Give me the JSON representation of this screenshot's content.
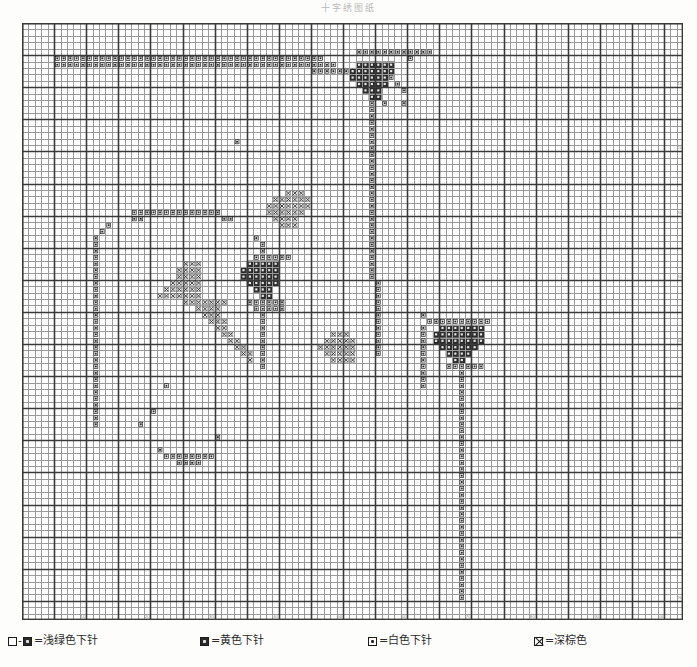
{
  "title": "十字绣图纸",
  "chart_data": {
    "type": "heatmap",
    "title": "十字绣图纸",
    "subtitle": "Cross-stitch pattern chart",
    "xlabel": "",
    "ylabel": "",
    "grid": true,
    "legend_position": "bottom",
    "columns": 103,
    "rows": 93,
    "cell_px": 6.42,
    "bold_every": 5,
    "axis_tick_interval": 10,
    "x_tick_labels": [
      "10",
      "20",
      "30",
      "40",
      "50",
      "60",
      "70",
      "80",
      "90",
      "100"
    ],
    "y_tick_labels": [
      "10",
      "20",
      "30",
      "40",
      "50",
      "60",
      "70",
      "80",
      "90"
    ],
    "symbols": {
      "A": "white-stitch",
      "X": "dark-brown-stitch",
      "F": "yellow-stitch",
      "G": "light-green-stitch"
    },
    "palette": {
      "background": "#ffffff",
      "grid_line": "#9a9a9a",
      "grid_bold": "#3a3a3a",
      "symbol_ink": "#222222",
      "fill_dark": "#2b2b2b"
    },
    "cells": [
      {
        "s": "A",
        "r": 5,
        "c": 5,
        "w": 38,
        "h": 2
      },
      {
        "s": "A",
        "r": 5,
        "c": 38,
        "w": 1,
        "h": 1
      },
      {
        "s": "A",
        "r": 4,
        "c": 52,
        "w": 12,
        "h": 1
      },
      {
        "s": "A",
        "r": 5,
        "c": 37,
        "w": 10,
        "h": 2
      },
      {
        "s": "A",
        "r": 6,
        "c": 41,
        "w": 8,
        "h": 1
      },
      {
        "s": "A",
        "r": 7,
        "c": 45,
        "w": 6,
        "h": 1
      },
      {
        "s": "A",
        "r": 4,
        "c": 60,
        "w": 1,
        "h": 1
      },
      {
        "s": "A",
        "r": 5,
        "c": 60,
        "w": 1,
        "h": 1
      },
      {
        "s": "F",
        "r": 6,
        "c": 52,
        "w": 6,
        "h": 1
      },
      {
        "s": "F",
        "r": 7,
        "c": 51,
        "w": 7,
        "h": 1
      },
      {
        "s": "F",
        "r": 8,
        "c": 51,
        "w": 6,
        "h": 1
      },
      {
        "s": "F",
        "r": 9,
        "c": 52,
        "w": 5,
        "h": 1
      },
      {
        "s": "F",
        "r": 10,
        "c": 53,
        "w": 3,
        "h": 1
      },
      {
        "s": "F",
        "r": 11,
        "c": 54,
        "w": 2,
        "h": 1
      },
      {
        "s": "A",
        "r": 8,
        "c": 57,
        "w": 1,
        "h": 1
      },
      {
        "s": "A",
        "r": 9,
        "c": 58,
        "w": 1,
        "h": 1
      },
      {
        "s": "A",
        "r": 10,
        "c": 59,
        "w": 1,
        "h": 1
      },
      {
        "s": "A",
        "r": 12,
        "c": 56,
        "w": 1,
        "h": 1
      },
      {
        "s": "A",
        "r": 12,
        "c": 59,
        "w": 1,
        "h": 1
      },
      {
        "s": "A",
        "r": 12,
        "c": 54,
        "w": 1,
        "h": 28
      },
      {
        "s": "A",
        "r": 40,
        "c": 55,
        "w": 1,
        "h": 12
      },
      {
        "s": "A",
        "r": 18,
        "c": 33,
        "w": 1,
        "h": 1
      },
      {
        "s": "X",
        "r": 26,
        "c": 41,
        "w": 3,
        "h": 1
      },
      {
        "s": "X",
        "r": 27,
        "c": 39,
        "w": 6,
        "h": 1
      },
      {
        "s": "X",
        "r": 28,
        "c": 38,
        "w": 7,
        "h": 1
      },
      {
        "s": "X",
        "r": 29,
        "c": 38,
        "w": 6,
        "h": 1
      },
      {
        "s": "X",
        "r": 30,
        "c": 39,
        "w": 4,
        "h": 1
      },
      {
        "s": "X",
        "r": 31,
        "c": 40,
        "w": 3,
        "h": 1
      },
      {
        "s": "A",
        "r": 29,
        "c": 17,
        "w": 14,
        "h": 1
      },
      {
        "s": "A",
        "r": 30,
        "c": 17,
        "w": 2,
        "h": 1
      },
      {
        "s": "A",
        "r": 30,
        "c": 31,
        "w": 2,
        "h": 1
      },
      {
        "s": "A",
        "r": 31,
        "c": 13,
        "w": 1,
        "h": 1
      },
      {
        "s": "A",
        "r": 32,
        "c": 12,
        "w": 1,
        "h": 1
      },
      {
        "s": "A",
        "r": 33,
        "c": 36,
        "w": 1,
        "h": 1
      },
      {
        "s": "A",
        "r": 33,
        "c": 11,
        "w": 1,
        "h": 30
      },
      {
        "s": "A",
        "r": 34,
        "c": 37,
        "w": 1,
        "h": 20
      },
      {
        "s": "X",
        "r": 37,
        "c": 25,
        "w": 3,
        "h": 1
      },
      {
        "s": "X",
        "r": 38,
        "c": 24,
        "w": 4,
        "h": 1
      },
      {
        "s": "X",
        "r": 39,
        "c": 24,
        "w": 4,
        "h": 1
      },
      {
        "s": "X",
        "r": 40,
        "c": 23,
        "w": 5,
        "h": 1
      },
      {
        "s": "X",
        "r": 41,
        "c": 22,
        "w": 6,
        "h": 1
      },
      {
        "s": "X",
        "r": 42,
        "c": 21,
        "w": 7,
        "h": 1
      },
      {
        "s": "X",
        "r": 43,
        "c": 25,
        "w": 7,
        "h": 1
      },
      {
        "s": "X",
        "r": 44,
        "c": 27,
        "w": 4,
        "h": 1
      },
      {
        "s": "X",
        "r": 45,
        "c": 28,
        "w": 3,
        "h": 1
      },
      {
        "s": "X",
        "r": 46,
        "c": 29,
        "w": 3,
        "h": 1
      },
      {
        "s": "X",
        "r": 47,
        "c": 30,
        "w": 2,
        "h": 1
      },
      {
        "s": "X",
        "r": 48,
        "c": 31,
        "w": 2,
        "h": 1
      },
      {
        "s": "X",
        "r": 49,
        "c": 32,
        "w": 2,
        "h": 1
      },
      {
        "s": "X",
        "r": 50,
        "c": 33,
        "w": 2,
        "h": 1
      },
      {
        "s": "X",
        "r": 51,
        "c": 34,
        "w": 2,
        "h": 1
      },
      {
        "s": "X",
        "r": 52,
        "c": 35,
        "w": 1,
        "h": 1
      },
      {
        "s": "F",
        "r": 37,
        "c": 35,
        "w": 5,
        "h": 1
      },
      {
        "s": "F",
        "r": 38,
        "c": 34,
        "w": 6,
        "h": 1
      },
      {
        "s": "F",
        "r": 39,
        "c": 34,
        "w": 6,
        "h": 1
      },
      {
        "s": "F",
        "r": 40,
        "c": 35,
        "w": 5,
        "h": 1
      },
      {
        "s": "F",
        "r": 41,
        "c": 36,
        "w": 3,
        "h": 1
      },
      {
        "s": "F",
        "r": 42,
        "c": 37,
        "w": 2,
        "h": 1
      },
      {
        "s": "A",
        "r": 36,
        "c": 36,
        "w": 6,
        "h": 1
      },
      {
        "s": "A",
        "r": 43,
        "c": 35,
        "w": 6,
        "h": 1
      },
      {
        "s": "A",
        "r": 44,
        "c": 36,
        "w": 5,
        "h": 1
      },
      {
        "s": "X",
        "r": 48,
        "c": 48,
        "w": 3,
        "h": 1
      },
      {
        "s": "X",
        "r": 49,
        "c": 47,
        "w": 5,
        "h": 1
      },
      {
        "s": "X",
        "r": 50,
        "c": 46,
        "w": 6,
        "h": 1
      },
      {
        "s": "X",
        "r": 51,
        "c": 47,
        "w": 5,
        "h": 1
      },
      {
        "s": "X",
        "r": 52,
        "c": 48,
        "w": 4,
        "h": 1
      },
      {
        "s": "F",
        "r": 47,
        "c": 65,
        "w": 7,
        "h": 1
      },
      {
        "s": "F",
        "r": 48,
        "c": 64,
        "w": 8,
        "h": 1
      },
      {
        "s": "F",
        "r": 49,
        "c": 64,
        "w": 8,
        "h": 1
      },
      {
        "s": "F",
        "r": 50,
        "c": 65,
        "w": 6,
        "h": 1
      },
      {
        "s": "F",
        "r": 51,
        "c": 66,
        "w": 4,
        "h": 1
      },
      {
        "s": "F",
        "r": 52,
        "c": 67,
        "w": 2,
        "h": 1
      },
      {
        "s": "A",
        "r": 46,
        "c": 63,
        "w": 10,
        "h": 1
      },
      {
        "s": "A",
        "r": 53,
        "c": 66,
        "w": 6,
        "h": 1
      },
      {
        "s": "A",
        "r": 45,
        "c": 62,
        "w": 1,
        "h": 1
      },
      {
        "s": "A",
        "r": 54,
        "c": 68,
        "w": 1,
        "h": 36
      },
      {
        "s": "A",
        "r": 47,
        "c": 62,
        "w": 1,
        "h": 10
      },
      {
        "s": "A",
        "r": 56,
        "c": 22,
        "w": 1,
        "h": 1
      },
      {
        "s": "A",
        "r": 60,
        "c": 20,
        "w": 1,
        "h": 1
      },
      {
        "s": "A",
        "r": 62,
        "c": 18,
        "w": 1,
        "h": 1
      },
      {
        "s": "A",
        "r": 64,
        "c": 30,
        "w": 1,
        "h": 1
      },
      {
        "s": "A",
        "r": 66,
        "c": 21,
        "w": 1,
        "h": 1
      },
      {
        "s": "A",
        "r": 67,
        "c": 22,
        "w": 8,
        "h": 1
      },
      {
        "s": "A",
        "r": 68,
        "c": 24,
        "w": 4,
        "h": 1
      }
    ]
  },
  "legend": {
    "entries": [
      {
        "id": "light-green",
        "symbol_left": "□",
        "dash": "-",
        "symbol_right": "■",
        "label": "=浅绿色下针",
        "swatch_type": "pair-filled"
      },
      {
        "id": "yellow",
        "symbol": "▣",
        "label": "=黄色下针",
        "swatch_type": "filled"
      },
      {
        "id": "white",
        "symbol": "⊡",
        "label": "=白色下针",
        "swatch_type": "dotbox"
      },
      {
        "id": "dark-brown",
        "symbol": "⊠",
        "label": "=深棕色",
        "swatch_type": "xbox"
      }
    ]
  }
}
